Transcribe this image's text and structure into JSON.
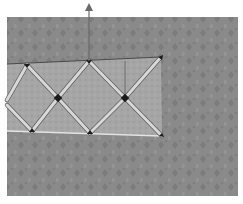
{
  "figure": {
    "colors": {
      "page_background": "#ffffff",
      "photo_background": "#8a8a8a",
      "photo_texture": "#7a7a7a",
      "truss_panel": "#a8a8a8",
      "rod": "#d6d6d6",
      "rod_edge": "#5a5a5a",
      "node": "#1a1a1a",
      "arrow": "#6a6a6a"
    },
    "photo": {
      "x": 7,
      "y": 17,
      "width": 231,
      "height": 179
    },
    "truss": {
      "top_chord": {
        "x1": 7,
        "y1": 64,
        "x2": 161,
        "y2": 57
      },
      "bottom_chord": {
        "x1": 7,
        "y1": 131,
        "x2": 162,
        "y2": 136
      },
      "top_nodes": [
        [
          27,
          65
        ],
        [
          89,
          61
        ]
      ],
      "middle_nodes": [
        [
          58,
          98
        ],
        [
          125,
          98
        ]
      ],
      "bottom_nodes": [
        [
          32,
          131
        ],
        [
          90,
          133
        ]
      ],
      "end_nodes": [
        [
          161,
          57
        ],
        [
          162,
          136
        ]
      ],
      "vertical_post": {
        "x": 125,
        "y1": 61,
        "y2": 98
      }
    },
    "force_arrow": {
      "x": 89,
      "y_tip": 3,
      "y_base": 61,
      "direction": "up"
    }
  }
}
